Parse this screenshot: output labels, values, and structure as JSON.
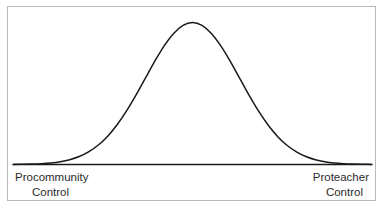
{
  "figure": {
    "caption_sliver": "DISTRIBUTION OF TEACHERS",
    "frame_color": "#b9b9b9",
    "background_color": "#ffffff",
    "curve_color": "#1a1a1a",
    "axis_color": "#1a1a1a",
    "label_color": "#2b2b2b"
  },
  "axis": {
    "left_label": {
      "line1": "Procommunity",
      "line2": "Control"
    },
    "right_label": {
      "line1": "Proteacher",
      "line2": "Control"
    }
  },
  "chart_data": {
    "type": "line",
    "title": "",
    "subtitle": "",
    "xlabel": "",
    "ylabel": "",
    "grid": false,
    "legend": "none",
    "distribution": "normal",
    "mean": 0,
    "std_dev": 1,
    "peak_height": 1.0,
    "xlim": [
      -3.8,
      3.8
    ],
    "ylim": [
      0,
      1.08
    ],
    "x_axis_endpoints": [
      "Procommunity Control",
      "Proteacher Control"
    ],
    "x": [
      -3.8,
      -3.6,
      -3.4,
      -3.2,
      -3.0,
      -2.8,
      -2.6,
      -2.4,
      -2.2,
      -2.0,
      -1.8,
      -1.6,
      -1.4,
      -1.2,
      -1.0,
      -0.8,
      -0.6,
      -0.4,
      -0.2,
      0.0,
      0.2,
      0.4,
      0.6,
      0.8,
      1.0,
      1.2,
      1.4,
      1.6,
      1.8,
      2.0,
      2.2,
      2.4,
      2.6,
      2.8,
      3.0,
      3.2,
      3.4,
      3.6,
      3.8
    ],
    "y": [
      0.0007,
      0.0015,
      0.0031,
      0.006,
      0.0111,
      0.0198,
      0.034,
      0.0561,
      0.0889,
      0.1353,
      0.1979,
      0.278,
      0.3753,
      0.4868,
      0.6065,
      0.7261,
      0.8353,
      0.9231,
      0.9802,
      1.0,
      0.9802,
      0.9231,
      0.8353,
      0.7261,
      0.6065,
      0.4868,
      0.3753,
      0.278,
      0.1979,
      0.1353,
      0.0889,
      0.0561,
      0.034,
      0.0198,
      0.0111,
      0.006,
      0.0031,
      0.0015,
      0.0007
    ],
    "series": [
      {
        "name": "Normal distribution of control orientation",
        "values": [
          0.0007,
          0.0015,
          0.0031,
          0.006,
          0.0111,
          0.0198,
          0.034,
          0.0561,
          0.0889,
          0.1353,
          0.1979,
          0.278,
          0.3753,
          0.4868,
          0.6065,
          0.7261,
          0.8353,
          0.9231,
          0.9802,
          1.0,
          0.9802,
          0.9231,
          0.8353,
          0.7261,
          0.6065,
          0.4868,
          0.3753,
          0.278,
          0.1979,
          0.1353,
          0.0889,
          0.0561,
          0.034,
          0.0198,
          0.0111,
          0.006,
          0.0031,
          0.0015,
          0.0007
        ]
      }
    ]
  }
}
